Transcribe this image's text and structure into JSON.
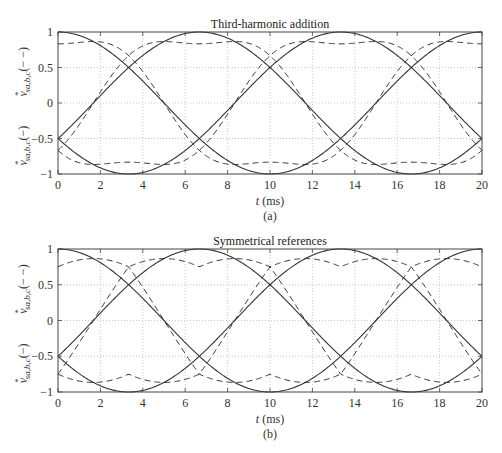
{
  "chart_data": [
    {
      "type": "line",
      "panel": "(a)",
      "title": "Third-harmonic addition",
      "xlabel": "t (ms)",
      "ylabel_top": "v*sa,b,c(− −)",
      "ylabel_bottom": "v*sa,b,c(−)",
      "xlim": [
        0,
        20
      ],
      "ylim": [
        -1,
        1
      ],
      "xticks": [
        0,
        2,
        4,
        6,
        8,
        10,
        12,
        14,
        16,
        18,
        20
      ],
      "yticks": [
        -1,
        -0.5,
        0,
        0.5,
        1
      ],
      "ytick_labels": [
        "−1",
        "−0.5",
        "0",
        "0.5",
        "1"
      ],
      "grid": true,
      "frequency_hz": 50,
      "series": [
        {
          "name": "v*sa (−)",
          "style": "solid",
          "formula": "cos(wt)",
          "phase_deg": 0
        },
        {
          "name": "v*sb (−)",
          "style": "solid",
          "formula": "cos(wt-120)",
          "phase_deg": -120
        },
        {
          "name": "v*sc (−)",
          "style": "solid",
          "formula": "cos(wt+120)",
          "phase_deg": 120
        },
        {
          "name": "v*sa (− −)",
          "style": "dashed",
          "formula": "third-harmonic",
          "phase_deg": 0,
          "peak": 0.87
        },
        {
          "name": "v*sb (− −)",
          "style": "dashed",
          "formula": "third-harmonic",
          "phase_deg": -120,
          "peak": 0.87
        },
        {
          "name": "v*sc (− −)",
          "style": "dashed",
          "formula": "third-harmonic",
          "phase_deg": 120,
          "peak": 0.87
        }
      ]
    },
    {
      "type": "line",
      "panel": "(b)",
      "title": "Symmetrical references",
      "xlabel": "t (ms)",
      "ylabel_top": "v*sa,b,c(− −)",
      "ylabel_bottom": "v*sa,b,c(−)",
      "xlim": [
        0,
        20
      ],
      "ylim": [
        -1,
        1
      ],
      "xticks": [
        0,
        2,
        4,
        6,
        8,
        10,
        12,
        14,
        16,
        18,
        20
      ],
      "yticks": [
        -1,
        -0.5,
        0,
        0.5,
        1
      ],
      "ytick_labels": [
        "−1",
        "−0.5",
        "0",
        "0.5",
        "1"
      ],
      "grid": true,
      "frequency_hz": 50,
      "series": [
        {
          "name": "v*sa (−)",
          "style": "solid",
          "formula": "cos(wt)",
          "phase_deg": 0
        },
        {
          "name": "v*sb (−)",
          "style": "solid",
          "formula": "cos(wt-120)",
          "phase_deg": -120
        },
        {
          "name": "v*sc (−)",
          "style": "solid",
          "formula": "cos(wt+120)",
          "phase_deg": 120
        },
        {
          "name": "v*sa (− −)",
          "style": "dashed",
          "formula": "min-max offset",
          "phase_deg": 0,
          "peak": 0.866
        },
        {
          "name": "v*sb (− −)",
          "style": "dashed",
          "formula": "min-max offset",
          "phase_deg": -120,
          "peak": 0.866
        },
        {
          "name": "v*sc (− −)",
          "style": "dashed",
          "formula": "min-max offset",
          "phase_deg": 120,
          "peak": 0.866
        }
      ]
    }
  ]
}
